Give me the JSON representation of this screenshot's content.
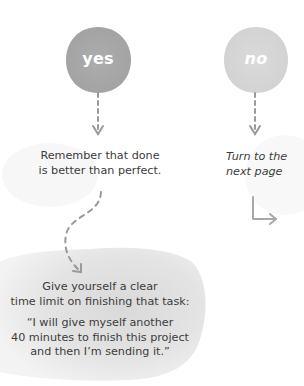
{
  "colors": {
    "yes_circle": "#a9a9a9",
    "no_circle": "#d8d8d8",
    "arrow": "#9a9a9a",
    "text": "#3c3c3c",
    "blob": "#e6e6e6",
    "faint_blob": "#f6f6f6"
  },
  "nodes": {
    "yes": {
      "label": "yes"
    },
    "no": {
      "label": "no"
    }
  },
  "yes_branch": {
    "message_line1": "Remember that done",
    "message_line2": "is better than perfect."
  },
  "no_branch": {
    "message_line1": "Turn to the",
    "message_line2": "next page"
  },
  "tip": {
    "line1": "Give yourself a clear",
    "line2": "time limit on finishing that task:",
    "quote_line1": "“I will give myself another",
    "quote_line2": "40 minutes to finish this project",
    "quote_line3": "and then I’m sending it.”"
  },
  "icons": {
    "yes_down_arrow": "dashed-arrow-down",
    "no_down_arrow": "dashed-arrow-down",
    "curved_arrow": "dashed-s-curve-arrow",
    "elbow_arrow": "elbow-arrow-right"
  }
}
